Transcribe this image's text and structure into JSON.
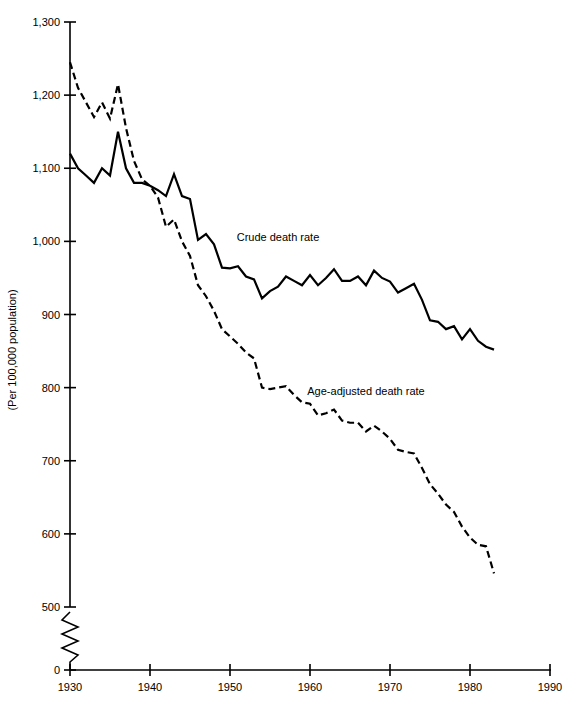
{
  "chart_data": {
    "type": "line",
    "title": "",
    "xlabel": "",
    "ylabel": "(Per 100,000 population)",
    "xlim": [
      1930,
      1990
    ],
    "ylim": [
      500,
      1300
    ],
    "y_axis_break": true,
    "y_axis_break_note": "axis broken between 0 and 500",
    "grid": false,
    "legend_position": "inline-annotation",
    "x_ticks": [
      "1930",
      "1940",
      "1950",
      "1960",
      "1970",
      "1980",
      "1990"
    ],
    "x_tick_values": [
      1930,
      1940,
      1950,
      1960,
      1970,
      1980,
      1990
    ],
    "y_ticks": [
      "0",
      "500",
      "600",
      "700",
      "800",
      "900",
      "1,000",
      "1,100",
      "1,200",
      "1,300"
    ],
    "y_tick_values": [
      0,
      500,
      600,
      700,
      800,
      900,
      1000,
      1100,
      1200,
      1300
    ],
    "x": [
      1930,
      1931,
      1932,
      1933,
      1934,
      1935,
      1936,
      1937,
      1938,
      1939,
      1940,
      1941,
      1942,
      1943,
      1944,
      1945,
      1946,
      1947,
      1948,
      1949,
      1950,
      1951,
      1952,
      1953,
      1954,
      1955,
      1956,
      1957,
      1958,
      1959,
      1960,
      1961,
      1962,
      1963,
      1964,
      1965,
      1966,
      1967,
      1968,
      1969,
      1970,
      1971,
      1972,
      1973,
      1974,
      1975,
      1976,
      1977,
      1978,
      1979,
      1980,
      1981,
      1982,
      1983
    ],
    "series": [
      {
        "name": "Crude death rate",
        "label": "Crude death rate",
        "style": "solid",
        "color": "#000000",
        "values": [
          1120,
          1100,
          1090,
          1080,
          1100,
          1090,
          1150,
          1100,
          1080,
          1080,
          1076,
          1070,
          1062,
          1092,
          1062,
          1058,
          1002,
          1010,
          996,
          964,
          963,
          966,
          952,
          948,
          922,
          932,
          938,
          952,
          946,
          940,
          954,
          940,
          950,
          962,
          946,
          946,
          952,
          940,
          960,
          950,
          945,
          930,
          936,
          942,
          920,
          892,
          890,
          880,
          884,
          866,
          880,
          864,
          856,
          852
        ]
      },
      {
        "name": "Age-adjusted death rate",
        "label": "Age-adjusted death rate",
        "style": "dashed",
        "color": "#000000",
        "values": [
          1245,
          1210,
          1190,
          1170,
          1190,
          1168,
          1215,
          1155,
          1110,
          1085,
          1076,
          1060,
          1020,
          1030,
          1000,
          980,
          940,
          925,
          905,
          880,
          870,
          860,
          848,
          840,
          800,
          798,
          800,
          802,
          790,
          780,
          778,
          762,
          765,
          770,
          755,
          752,
          752,
          740,
          748,
          740,
          730,
          715,
          712,
          710,
          690,
          668,
          655,
          640,
          630,
          610,
          595,
          585,
          583,
          546
        ]
      }
    ],
    "annotations": [
      {
        "text": "Crude death rate",
        "x": 1956,
        "y": 1000
      },
      {
        "text": "Age-adjusted death rate",
        "x": 1967,
        "y": 790
      }
    ]
  },
  "axis": {
    "y_title": "(Per 100,000 population)"
  }
}
